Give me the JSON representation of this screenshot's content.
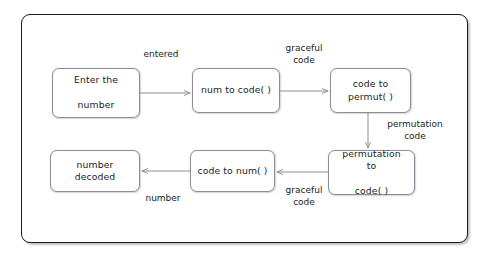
{
  "diagram": {
    "frame": {
      "border_color": "#1a1a24",
      "background": "#ffffff"
    },
    "node_style": {
      "border_color": "#8d8d97",
      "text_color": "#1c1c22"
    },
    "nodes": [
      {
        "id": "enter",
        "label": "Enter the\nnumber",
        "line1": "Enter the",
        "line2": "number"
      },
      {
        "id": "num_to_code",
        "label": "num to code( )",
        "line1": "num to code( )",
        "line2": ""
      },
      {
        "id": "code_permut",
        "label": "code to permut( )",
        "line1": "code to permut( )",
        "line2": ""
      },
      {
        "id": "perm_code",
        "label": "permutation to\ncode( )",
        "line1": "permutation to",
        "line2": "code( )"
      },
      {
        "id": "code_to_num",
        "label": "code to num( )",
        "line1": "code to num( )",
        "line2": ""
      },
      {
        "id": "decoded",
        "label": "number decoded",
        "line1": "number decoded",
        "line2": ""
      }
    ],
    "edges": [
      {
        "id": "e1",
        "from": "enter",
        "to": "num_to_code",
        "label": "entered",
        "line1": "entered",
        "line2": ""
      },
      {
        "id": "e2",
        "from": "num_to_code",
        "to": "code_permut",
        "label": "graceful code",
        "line1": "graceful",
        "line2": "code"
      },
      {
        "id": "e3",
        "from": "code_permut",
        "to": "perm_code",
        "label": "permutation code",
        "line1": "permutation",
        "line2": "code"
      },
      {
        "id": "e4",
        "from": "perm_code",
        "to": "code_to_num",
        "label": "graceful code",
        "line1": "graceful",
        "line2": "code"
      },
      {
        "id": "e5",
        "from": "code_to_num",
        "to": "decoded",
        "label": "number",
        "line1": "number",
        "line2": ""
      }
    ]
  }
}
